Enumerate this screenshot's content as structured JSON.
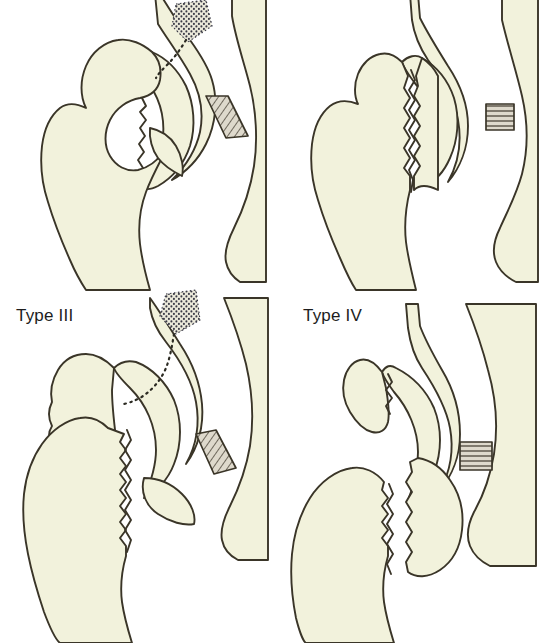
{
  "figure": {
    "background_color": "#ffffff",
    "bone_fill_color": "#f2f2dc",
    "outline_color": "#3a3528",
    "hatch_color": "#8a8478",
    "label_color": "#1d1d1d",
    "caption": ""
  },
  "panels": [
    {
      "id": "panel-1",
      "label": "",
      "position": "top-left",
      "description": "Femoral head and acetabulum with stippled fracture fragment and dotted fracture line, hatched ligamentum teres band"
    },
    {
      "id": "panel-2",
      "label": "",
      "position": "top-right",
      "description": "Displaced vertical femoral neck fracture with hatched ligament band"
    },
    {
      "id": "panel-3",
      "label": "Type III",
      "position": "bottom-left",
      "description": "Severely displaced fracture with free bone fragment, stippled acetabular region and dotted fracture line"
    },
    {
      "id": "panel-4",
      "label": "Type IV",
      "position": "bottom-right",
      "description": "Comminuted fracture with separated femoral head fragment and hatched ligament band"
    }
  ],
  "markings": {
    "stipple_name": "stippled-fracture-zone",
    "dotted_line_name": "dotted-fracture-line",
    "hatch_band_name": "hatched-ligament-band"
  }
}
